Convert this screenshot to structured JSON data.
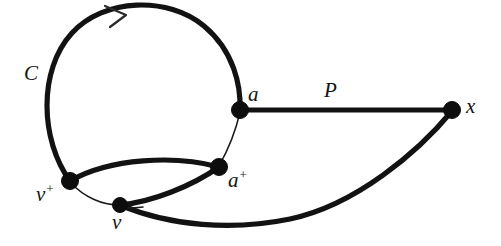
{
  "figure": {
    "kind": "graph-diagram",
    "width": 501,
    "height": 246,
    "background_color": "#ffffff",
    "ink_color": "#121212"
  },
  "labels": {
    "cycle": "C",
    "path": "P",
    "vertex_a": "a",
    "vertex_a_plus_base": "a",
    "vertex_a_plus_sup": "+",
    "vertex_v_plus_base": "v",
    "vertex_v_plus_sup": "+",
    "vertex_v": "v",
    "vertex_x": "x"
  },
  "vertices": [
    {
      "id": "a",
      "label": "a",
      "x": 240,
      "y": 110,
      "r": 8.5
    },
    {
      "id": "x",
      "label": "x",
      "x": 452,
      "y": 110,
      "r": 8.5
    },
    {
      "id": "a_plus",
      "label": "a+",
      "x": 219,
      "y": 167,
      "r": 8.5
    },
    {
      "id": "v_plus",
      "label": "v+",
      "x": 70,
      "y": 181,
      "r": 8.5
    },
    {
      "id": "v",
      "label": "v",
      "x": 120,
      "y": 205,
      "r": 7.5
    }
  ],
  "edges": [
    {
      "id": "cycle-arc",
      "from": "v_plus",
      "to": "a",
      "style": "thick",
      "shape": "large-arc-clockwise"
    },
    {
      "id": "path-a-x",
      "from": "a",
      "to": "x",
      "style": "thick",
      "shape": "straight"
    },
    {
      "id": "vplus-aplus",
      "from": "v_plus",
      "to": "a_plus",
      "style": "thick",
      "shape": "arc-up"
    },
    {
      "id": "v-aplus",
      "from": "v",
      "to": "a_plus",
      "style": "thick",
      "shape": "arc-up-right"
    },
    {
      "id": "v-x",
      "from": "v",
      "to": "x",
      "style": "thick",
      "shape": "arc-down-sweep"
    },
    {
      "id": "a-aplus-thin",
      "from": "a",
      "to": "a_plus",
      "style": "thin",
      "shape": "gentle-curve"
    },
    {
      "id": "vplus-v-thin",
      "from": "v_plus",
      "to": "v",
      "style": "thin",
      "shape": "gentle-curve"
    }
  ],
  "arrow": {
    "id": "cycle-direction-arrow",
    "x": 118,
    "y": 13,
    "direction": "clockwise"
  },
  "label_positions": {
    "cycle": {
      "x": 24,
      "y": 63
    },
    "path": {
      "x": 324,
      "y": 80
    },
    "vertex_a": {
      "x": 248,
      "y": 84
    },
    "vertex_a_plus": {
      "x": 228,
      "y": 168
    },
    "vertex_v_plus": {
      "x": 36,
      "y": 182
    },
    "vertex_v": {
      "x": 112,
      "y": 212
    },
    "vertex_x": {
      "x": 466,
      "y": 96
    }
  }
}
